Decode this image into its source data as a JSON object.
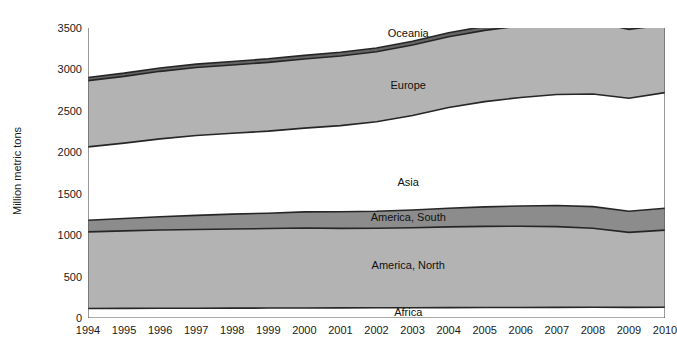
{
  "chart_data": {
    "type": "area",
    "stacked": true,
    "title": "",
    "xlabel": "",
    "ylabel": "Million metric tons",
    "ylim": [
      0,
      3500
    ],
    "yticks": [
      0,
      500,
      1000,
      1500,
      2000,
      2500,
      3000,
      3500
    ],
    "grid": false,
    "legend_position": "inline-labels",
    "categories": [
      "1994",
      "1995",
      "1996",
      "1997",
      "1998",
      "1999",
      "2000",
      "2001",
      "2002",
      "2003",
      "2004",
      "2005",
      "2006",
      "2007",
      "2008",
      "2009",
      "2010"
    ],
    "series": [
      {
        "name": "Africa",
        "color": "#ffffff",
        "label_x_year": "2002",
        "values": [
          115,
          116,
          117,
          118,
          119,
          120,
          121,
          122,
          123,
          124,
          125,
          126,
          127,
          128,
          129,
          128,
          130
        ]
      },
      {
        "name": "America, North",
        "color": "#b3b3b3",
        "label_x_year": "2002",
        "values": [
          925,
          935,
          945,
          950,
          955,
          960,
          965,
          960,
          960,
          965,
          975,
          980,
          980,
          975,
          955,
          905,
          930
        ]
      },
      {
        "name": "America, South",
        "color": "#8c8c8c",
        "label_x_year": "2002",
        "values": [
          140,
          150,
          160,
          170,
          180,
          185,
          195,
          200,
          205,
          215,
          225,
          235,
          245,
          255,
          260,
          255,
          265
        ]
      },
      {
        "name": "Asia",
        "color": "#ffffff",
        "label_x_year": "2002",
        "values": [
          885,
          910,
          940,
          965,
          975,
          990,
          1010,
          1040,
          1080,
          1140,
          1215,
          1270,
          1310,
          1340,
          1360,
          1365,
          1395
        ]
      },
      {
        "name": "Europe",
        "color": "#b3b3b3",
        "label_x_year": "2002",
        "values": [
          800,
          805,
          815,
          820,
          825,
          830,
          835,
          840,
          845,
          850,
          855,
          860,
          865,
          870,
          875,
          830,
          820
        ]
      },
      {
        "name": "Oceania",
        "color": "#666666",
        "label_x_year": "2002",
        "values": [
          38,
          39,
          40,
          41,
          42,
          43,
          44,
          45,
          46,
          47,
          48,
          49,
          50,
          51,
          52,
          50,
          51
        ]
      }
    ],
    "series_label_positions": [
      {
        "name": "Africa",
        "x_pct": 55.5,
        "value": 75
      },
      {
        "name": "America, North",
        "x_pct": 55.5,
        "value": 640
      },
      {
        "name": "America, South",
        "x_pct": 55.5,
        "value": 1225
      },
      {
        "name": "Asia",
        "x_pct": 55.5,
        "value": 1640
      },
      {
        "name": "Europe",
        "x_pct": 55.5,
        "value": 2810
      },
      {
        "name": "Oceania",
        "x_pct": 55.5,
        "value": 3440
      }
    ],
    "totals": [
      2903,
      2955,
      3017,
      3064,
      3096,
      3128,
      3170,
      3207,
      3259,
      3341,
      3443,
      3520,
      3577,
      3619,
      3631,
      3533,
      3591
    ],
    "stroke_color": "#262626",
    "axis_color": "#555555"
  }
}
